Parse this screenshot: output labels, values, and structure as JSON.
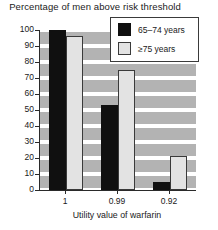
{
  "chart_data": {
    "type": "bar",
    "title": "Percentage of men above risk threshold",
    "xlabel": "Utility value of warfarin",
    "ylabel": "",
    "categories": [
      "1",
      "0.99",
      "0.92"
    ],
    "series": [
      {
        "name": "65–74 years",
        "values": [
          100,
          53,
          5
        ],
        "color": "#101010"
      },
      {
        "name": "≥75 years",
        "values": [
          96,
          75,
          21
        ],
        "color": "#e3e3e3"
      }
    ],
    "ylim": [
      0,
      100
    ],
    "yticks": [
      0,
      10,
      20,
      30,
      40,
      50,
      60,
      70,
      80,
      90,
      100
    ],
    "ytick_labels": [
      "0",
      "10",
      "20",
      "30",
      "40",
      "50",
      "60",
      "70",
      "80",
      "90",
      "100"
    ],
    "grid": true,
    "grid_style": "horizontal-gray-bands",
    "legend_position": "top-right"
  },
  "legend": {
    "items": [
      {
        "label": "65–74 years",
        "swatch": "dark"
      },
      {
        "label": "≥75 years",
        "swatch": "light"
      }
    ]
  }
}
